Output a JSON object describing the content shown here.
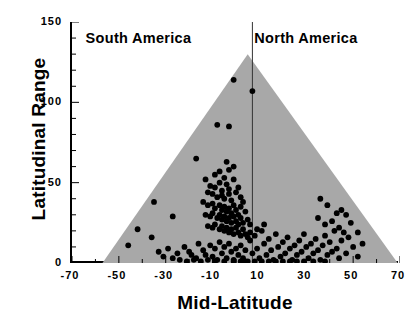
{
  "chart_data": {
    "type": "scatter",
    "title": "",
    "xlabel": "Mid-Latitude",
    "ylabel": "Latitudinal Range",
    "xlim": [
      -70,
      70
    ],
    "ylim": [
      0,
      150
    ],
    "xticks": [
      -70,
      -50,
      -30,
      -10,
      10,
      30,
      50,
      70
    ],
    "yticks": [
      0,
      50,
      100,
      150
    ],
    "x_minor_step": 10,
    "y_minor_step": 10,
    "grid": false,
    "legend": "none",
    "annotations": [
      {
        "text": "South America",
        "x": -42,
        "y": 140
      },
      {
        "text": "North America",
        "x": 30,
        "y": 140
      }
    ],
    "divider_line": {
      "x": 7,
      "label": "continent-split"
    },
    "shaded_region": {
      "name": "rapoport-envelope-triangle",
      "color": "#a8a8a8",
      "vertices": [
        [
          -57,
          0
        ],
        [
          5,
          130
        ],
        [
          69,
          0
        ]
      ]
    },
    "marker": {
      "shape": "circle",
      "color": "#000000",
      "size": 4.2
    },
    "series": [
      {
        "name": "species",
        "points": [
          [
            -1,
            114
          ],
          [
            7,
            107
          ],
          [
            -8,
            86
          ],
          [
            -3,
            85
          ],
          [
            -17,
            65
          ],
          [
            -4,
            63
          ],
          [
            -1,
            60
          ],
          [
            -13,
            52
          ],
          [
            -9,
            55
          ],
          [
            -7,
            57
          ],
          [
            -5,
            53
          ],
          [
            -3,
            58
          ],
          [
            -11,
            48
          ],
          [
            -9,
            47
          ],
          [
            -7,
            50
          ],
          [
            -6,
            45
          ],
          [
            -4,
            49
          ],
          [
            -3,
            46
          ],
          [
            -1,
            52
          ],
          [
            1,
            47
          ],
          [
            -12,
            44
          ],
          [
            -10,
            43
          ],
          [
            -8,
            41
          ],
          [
            -6,
            42
          ],
          [
            -5,
            40
          ],
          [
            -3,
            43
          ],
          [
            -2,
            39
          ],
          [
            0,
            44
          ],
          [
            2,
            41
          ],
          [
            3,
            38
          ],
          [
            -14,
            38
          ],
          [
            -12,
            36
          ],
          [
            -10,
            37
          ],
          [
            -9,
            34
          ],
          [
            -7,
            36
          ],
          [
            -6,
            33
          ],
          [
            -5,
            35
          ],
          [
            -4,
            32
          ],
          [
            -3,
            34
          ],
          [
            -2,
            31
          ],
          [
            -1,
            36
          ],
          [
            0,
            33
          ],
          [
            1,
            30
          ],
          [
            2,
            35
          ],
          [
            4,
            32
          ],
          [
            -13,
            30
          ],
          [
            -11,
            29
          ],
          [
            -10,
            31
          ],
          [
            -8,
            28
          ],
          [
            -7,
            30
          ],
          [
            -6,
            27
          ],
          [
            -5,
            29
          ],
          [
            -4,
            26
          ],
          [
            -3,
            28
          ],
          [
            -2,
            25
          ],
          [
            -1,
            29
          ],
          [
            0,
            26
          ],
          [
            1,
            24
          ],
          [
            2,
            28
          ],
          [
            3,
            25
          ],
          [
            5,
            27
          ],
          [
            6,
            24
          ],
          [
            -12,
            23
          ],
          [
            -10,
            22
          ],
          [
            -9,
            24
          ],
          [
            -7,
            21
          ],
          [
            -6,
            23
          ],
          [
            -5,
            20
          ],
          [
            -4,
            22
          ],
          [
            -3,
            19
          ],
          [
            -2,
            21
          ],
          [
            -1,
            18
          ],
          [
            0,
            22
          ],
          [
            1,
            19
          ],
          [
            2,
            17
          ],
          [
            3,
            21
          ],
          [
            4,
            18
          ],
          [
            -35,
            38
          ],
          [
            -27,
            29
          ],
          [
            -42,
            21
          ],
          [
            -36,
            16
          ],
          [
            -46,
            11
          ],
          [
            -33,
            7
          ],
          [
            -29,
            9
          ],
          [
            -25,
            6
          ],
          [
            -22,
            10
          ],
          [
            -19,
            5
          ],
          [
            -31,
            4
          ],
          [
            -27,
            3
          ],
          [
            -24,
            2
          ],
          [
            -20,
            7
          ],
          [
            -17,
            3
          ],
          [
            -16,
            12
          ],
          [
            -14,
            8
          ],
          [
            -13,
            5
          ],
          [
            -11,
            11
          ],
          [
            -10,
            4
          ],
          [
            -9,
            9
          ],
          [
            -8,
            2
          ],
          [
            -7,
            13
          ],
          [
            -6,
            6
          ],
          [
            -5,
            10
          ],
          [
            -4,
            3
          ],
          [
            -3,
            12
          ],
          [
            -2,
            7
          ],
          [
            -1,
            2
          ],
          [
            0,
            9
          ],
          [
            1,
            5
          ],
          [
            2,
            11
          ],
          [
            3,
            3
          ],
          [
            4,
            8
          ],
          [
            5,
            1
          ],
          [
            -15,
            1
          ],
          [
            -12,
            2
          ],
          [
            -21,
            1
          ],
          [
            -18,
            2
          ],
          [
            6,
            14
          ],
          [
            7,
            6
          ],
          [
            8,
            17
          ],
          [
            9,
            9
          ],
          [
            10,
            3
          ],
          [
            11,
            20
          ],
          [
            12,
            12
          ],
          [
            13,
            5
          ],
          [
            14,
            15
          ],
          [
            15,
            8
          ],
          [
            16,
            2
          ],
          [
            17,
            18
          ],
          [
            18,
            10
          ],
          [
            19,
            4
          ],
          [
            20,
            13
          ],
          [
            21,
            6
          ],
          [
            22,
            16
          ],
          [
            23,
            9
          ],
          [
            24,
            2
          ],
          [
            25,
            11
          ],
          [
            26,
            5
          ],
          [
            27,
            14
          ],
          [
            28,
            7
          ],
          [
            29,
            18
          ],
          [
            30,
            10
          ],
          [
            31,
            3
          ],
          [
            32,
            12
          ],
          [
            33,
            6
          ],
          [
            34,
            15
          ],
          [
            35,
            8
          ],
          [
            36,
            2
          ],
          [
            37,
            11
          ],
          [
            38,
            17
          ],
          [
            39,
            5
          ],
          [
            40,
            13
          ],
          [
            41,
            7
          ],
          [
            42,
            20
          ],
          [
            43,
            9
          ],
          [
            44,
            3
          ],
          [
            45,
            14
          ],
          [
            47,
            6
          ],
          [
            48,
            16
          ],
          [
            50,
            10
          ],
          [
            52,
            4
          ],
          [
            54,
            12
          ],
          [
            44,
            22
          ],
          [
            41,
            26
          ],
          [
            46,
            19
          ],
          [
            38,
            24
          ],
          [
            35,
            28
          ],
          [
            49,
            25
          ],
          [
            43,
            31
          ],
          [
            52,
            19
          ],
          [
            47,
            30
          ],
          [
            39,
            36
          ],
          [
            45,
            33
          ],
          [
            36,
            40
          ],
          [
            8,
            1
          ],
          [
            11,
            1
          ],
          [
            14,
            1
          ],
          [
            17,
            1
          ],
          [
            20,
            1
          ],
          [
            23,
            1
          ],
          [
            26,
            1
          ],
          [
            29,
            1
          ],
          [
            33,
            1
          ],
          [
            38,
            1
          ],
          [
            12,
            24
          ],
          [
            9,
            21
          ],
          [
            6,
            19
          ],
          [
            5,
            16
          ],
          [
            -1,
            1
          ],
          [
            2,
            1
          ],
          [
            4,
            1
          ],
          [
            -5,
            1
          ],
          [
            -9,
            1
          ]
        ]
      }
    ]
  }
}
